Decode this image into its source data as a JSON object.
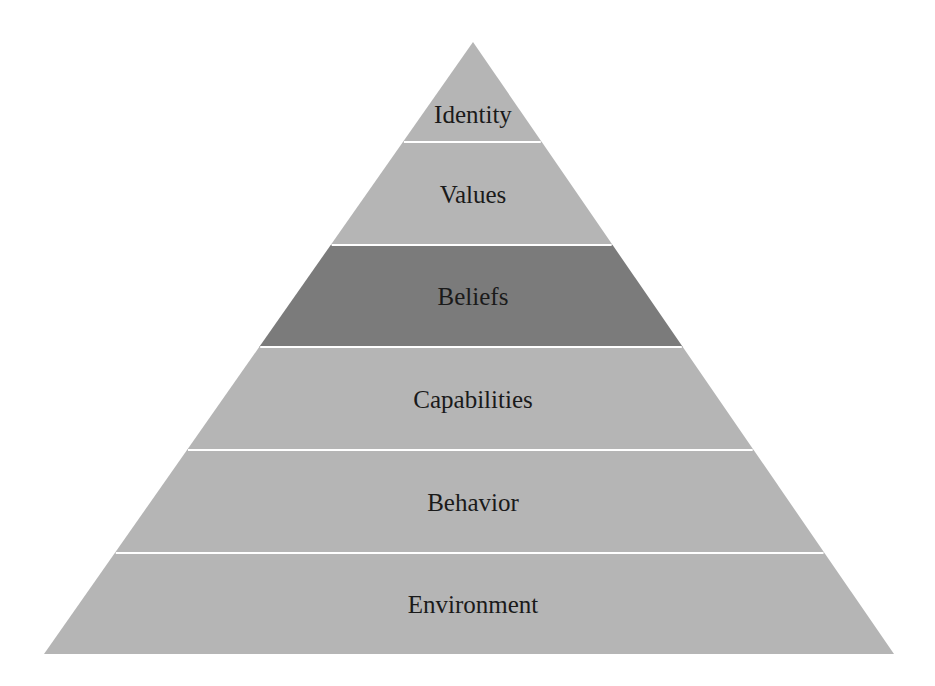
{
  "diagram": {
    "type": "pyramid",
    "apex": {
      "x": 473,
      "y": 42
    },
    "base": {
      "left_x": 44,
      "right_x": 894,
      "y": 654
    },
    "colors": {
      "band": "#b5b5b5",
      "highlight_band": "#7b7b7b",
      "separator": "#ffffff",
      "text": "#1a1a1a"
    },
    "layers": [
      {
        "label": "Identity",
        "top_y": 42,
        "bottom_y": 142,
        "highlighted": false
      },
      {
        "label": "Values",
        "top_y": 142,
        "bottom_y": 245,
        "highlighted": false
      },
      {
        "label": "Beliefs",
        "top_y": 245,
        "bottom_y": 347,
        "highlighted": true
      },
      {
        "label": "Capabilities",
        "top_y": 347,
        "bottom_y": 450,
        "highlighted": false
      },
      {
        "label": "Behavior",
        "top_y": 450,
        "bottom_y": 553,
        "highlighted": false
      },
      {
        "label": "Environment",
        "top_y": 553,
        "bottom_y": 654,
        "highlighted": false
      }
    ]
  }
}
